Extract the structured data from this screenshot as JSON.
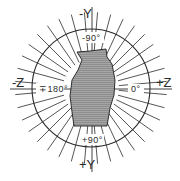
{
  "diagram": {
    "type": "polar-orientation-diagram",
    "axis_labels": {
      "top": "-Y",
      "bottom": "+Y",
      "left": "-Z",
      "right": "+Z"
    },
    "angle_labels": {
      "top": "-90°",
      "bottom": "+90°",
      "left": "∓180°",
      "right": "0°"
    },
    "colors": {
      "line": "#2a2a2a",
      "shape_fill": "#9a9a9a",
      "background": "#ffffff"
    },
    "ray_count": 36,
    "ray_spacing_deg": 10
  }
}
